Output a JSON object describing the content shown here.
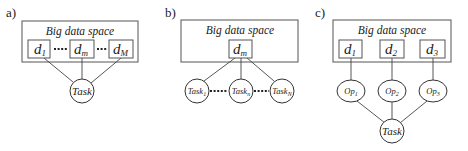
{
  "panels": [
    {
      "id": "a",
      "label": "a)",
      "space_title": "Big data space",
      "data_items": [
        {
          "base": "d",
          "sub": "1"
        },
        {
          "base": "d",
          "sub": "m"
        },
        {
          "base": "d",
          "sub": "M"
        }
      ],
      "task": {
        "label": "Task"
      }
    },
    {
      "id": "b",
      "label": "b)",
      "space_title": "Big data space",
      "data_items": [
        {
          "base": "d",
          "sub": "m"
        }
      ],
      "tasks": [
        {
          "base": "Task",
          "sub": "1"
        },
        {
          "base": "Task",
          "sub": "n"
        },
        {
          "base": "Task",
          "sub": "N"
        }
      ]
    },
    {
      "id": "c",
      "label": "c)",
      "space_title": "Big data space",
      "data_items": [
        {
          "base": "d",
          "sub": "1"
        },
        {
          "base": "d",
          "sub": "2"
        },
        {
          "base": "d",
          "sub": "3"
        }
      ],
      "ops": [
        {
          "base": "Op",
          "sub": "1"
        },
        {
          "base": "Op",
          "sub": "2"
        },
        {
          "base": "Op",
          "sub": "3"
        }
      ],
      "task": {
        "label": "Task"
      }
    }
  ]
}
